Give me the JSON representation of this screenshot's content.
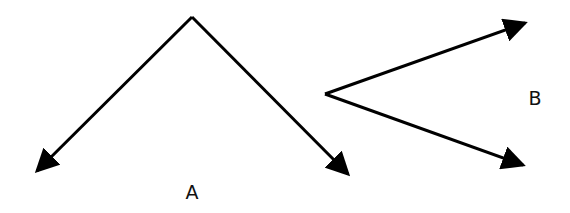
{
  "figure": {
    "width": 570,
    "height": 213,
    "background": "#ffffff",
    "stroke_color": "#000000",
    "stroke_width": 3
  },
  "diagrams": [
    {
      "id": "A",
      "label": "A",
      "label_pos": [
        192,
        192
      ],
      "vertex": [
        192,
        17
      ],
      "arrows": [
        {
          "from": [
            192,
            17
          ],
          "to": [
            37,
            171
          ]
        },
        {
          "from": [
            192,
            17
          ],
          "to": [
            348,
            174
          ]
        }
      ]
    },
    {
      "id": "B",
      "label": "B",
      "label_pos": [
        535,
        98
      ],
      "vertex": [
        325,
        94
      ],
      "arrows": [
        {
          "from": [
            325,
            94
          ],
          "to": [
            525,
            23
          ]
        },
        {
          "from": [
            325,
            94
          ],
          "to": [
            523,
            165
          ]
        }
      ]
    }
  ]
}
